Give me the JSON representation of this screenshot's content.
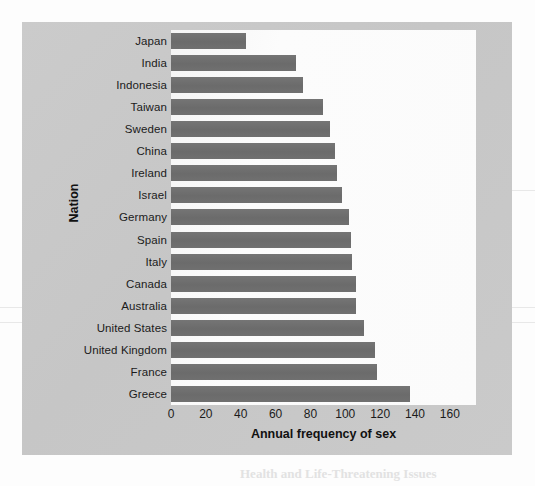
{
  "figure": {
    "panel_color": "#c9c9c9",
    "plot_background": "#fafafa",
    "bar_color": "#6e6e6e"
  },
  "artifacts": {
    "bottom_bleed": "Health and Life-Threatening Issues"
  },
  "chart_data": {
    "type": "bar",
    "orientation": "horizontal",
    "title": "",
    "xlabel": "Annual frequency of sex",
    "ylabel": "Nation",
    "xlim": [
      0,
      175
    ],
    "xticks": [
      0,
      20,
      40,
      60,
      80,
      100,
      120,
      140,
      160
    ],
    "xtick_labels": [
      "0",
      "20",
      "40",
      "60",
      "80",
      "100",
      "120",
      "140",
      "160"
    ],
    "grid": false,
    "legend": "none",
    "categories": [
      "Japan",
      "India",
      "Indonesia",
      "Taiwan",
      "Sweden",
      "China",
      "Ireland",
      "Israel",
      "Germany",
      "Spain",
      "Italy",
      "Canada",
      "Australia",
      "United States",
      "United  Kingdom",
      "France",
      "Greece"
    ],
    "values": [
      43,
      72,
      76,
      87,
      91,
      94,
      95,
      98,
      102,
      103,
      104,
      106,
      106,
      111,
      117,
      118,
      137
    ]
  }
}
